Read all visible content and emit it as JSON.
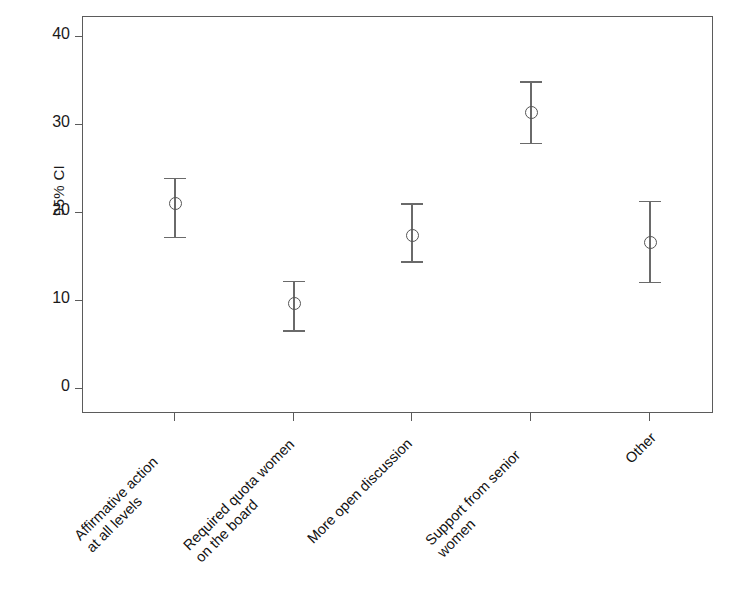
{
  "chart_data": {
    "type": "scatter",
    "title": "",
    "xlabel": "",
    "ylabel": "95% CI",
    "ylim": [
      0,
      43
    ],
    "yticks": [
      0,
      10,
      20,
      30,
      40
    ],
    "ytick_labels": [
      "0",
      "10",
      "20",
      "30",
      "40"
    ],
    "grid": false,
    "legend": null,
    "error_bar_type": "95% confidence interval",
    "categories": [
      "Affirmative action\nat all levels",
      "Required quota women\non the board",
      "More open discussion",
      "Support from senior\nwomen",
      "Other"
    ],
    "values": [
      21.1,
      9.7,
      17.4,
      31.4,
      16.6
    ],
    "ci_lower": [
      17.3,
      6.7,
      14.5,
      28.0,
      12.2
    ],
    "ci_upper": [
      24.0,
      12.3,
      21.1,
      35.0,
      21.4
    ],
    "marker": "open-circle",
    "colors": {
      "axis": "#5b5b5b",
      "marker_stroke": "#555555",
      "errorbar": "#6a6a6a",
      "text": "#1a1a1a",
      "background": "#ffffff"
    }
  },
  "axes": {
    "y_title": "95% CI"
  }
}
